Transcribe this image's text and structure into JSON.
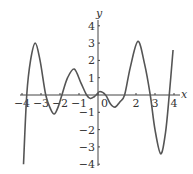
{
  "chart_data": {
    "type": "line",
    "title": "",
    "xlabel": "x",
    "ylabel": "y",
    "xlim": [
      -4,
      4
    ],
    "ylim": [
      -4,
      4
    ],
    "grid": false,
    "x_ticks": [
      "-4",
      "-3",
      "-2",
      "-1",
      "0",
      "2",
      "3",
      "4"
    ],
    "y_ticks": [
      "4",
      "3",
      "2",
      "1",
      "-1",
      "-2",
      "-3",
      "-4"
    ],
    "series": [
      {
        "name": "f(x)",
        "x": [
          -3.92,
          -3.75,
          -3.55,
          -3.3,
          -3.05,
          -2.75,
          -2.5,
          -2.3,
          -2.1,
          -1.9,
          -1.6,
          -1.25,
          -0.9,
          -0.6,
          -0.4,
          -0.2,
          -0.1,
          0.1,
          0.4,
          0.65,
          0.9,
          1.15,
          1.4,
          1.7,
          2.1,
          2.45,
          2.75,
          3.0,
          3.3,
          3.55,
          3.75,
          3.95
        ],
        "y": [
          -4.0,
          0.0,
          2.0,
          3.0,
          2.0,
          0.0,
          -0.8,
          -1.1,
          -0.7,
          0.0,
          1.0,
          1.5,
          0.7,
          0.0,
          -0.2,
          -0.1,
          0.0,
          0.2,
          0.0,
          -0.5,
          -0.7,
          -0.4,
          0.0,
          1.6,
          3.1,
          1.8,
          0.0,
          -2.0,
          -3.4,
          -2.2,
          0.0,
          2.6
        ]
      }
    ]
  },
  "labels": {
    "x_axis": "x",
    "y_axis": "y"
  }
}
